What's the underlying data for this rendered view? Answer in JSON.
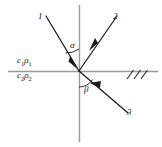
{
  "figure": {
    "background_color": "#ffffff",
    "axis_color": "#9a9a9a",
    "ray_color": "#1a1a1a",
    "label_color": "#1a1a1a",
    "origin": {
      "x": 79,
      "y": 71
    },
    "axes": {
      "horizontal": {
        "name": "interface-line",
        "x1": 8,
        "y1": 71,
        "x2": 158,
        "y2": 71
      },
      "vertical": {
        "name": "normal-line",
        "x1": 79,
        "y1": 5,
        "x2": 79,
        "y2": 142
      }
    },
    "rays": [
      {
        "id": "ray-1",
        "label": "1",
        "role": "incident-ray",
        "x1": 47,
        "y1": 17,
        "x2": 79,
        "y2": 71,
        "arrow": "toward-origin"
      },
      {
        "id": "ray-2",
        "label": "2",
        "role": "reflected-ray",
        "x1": 79,
        "y1": 71,
        "x2": 116,
        "y2": 17,
        "arrow": "away-from-origin"
      },
      {
        "id": "ray-3",
        "label": "3",
        "role": "refracted-ray",
        "x1": 79,
        "y1": 71,
        "x2": 127,
        "y2": 112,
        "arrow": "away-from-origin"
      }
    ],
    "angles": [
      {
        "id": "angle-alpha",
        "label": "α",
        "between": [
          "ray-1",
          "normal-line-up"
        ],
        "arc_radius": 22
      },
      {
        "id": "angle-beta",
        "label": "β",
        "between": [
          "normal-line-down",
          "ray-3"
        ],
        "arc_radius": 16
      }
    ],
    "media": [
      {
        "id": "medium-upper",
        "label_c": "c",
        "label_sub_c": "1",
        "label_rho": "ρ",
        "label_sub_rho": "1",
        "text": "c₁ρ₁"
      },
      {
        "id": "medium-lower",
        "label_c": "c",
        "label_sub_c": "2",
        "label_rho": "ρ",
        "label_sub_rho": "2",
        "text": "c₂ρ₂"
      }
    ],
    "hatching": {
      "id": "boundary-hatching",
      "count": 3,
      "marks": [
        {
          "x1": 127,
          "y1": 78,
          "x2": 133,
          "y2": 70
        },
        {
          "x1": 134,
          "y1": 78,
          "x2": 140,
          "y2": 70
        },
        {
          "x1": 141,
          "y1": 78,
          "x2": 147,
          "y2": 70
        }
      ]
    }
  },
  "labels": {
    "ray1": "1",
    "ray2": "2",
    "ray3": "3",
    "alpha": "α",
    "beta": "β",
    "medium1_c": "c",
    "medium1_c_sub": "1",
    "medium1_rho": "ρ",
    "medium1_rho_sub": "1",
    "medium2_c": "c",
    "medium2_c_sub": "2",
    "medium2_rho": "ρ",
    "medium2_rho_sub": "2"
  }
}
